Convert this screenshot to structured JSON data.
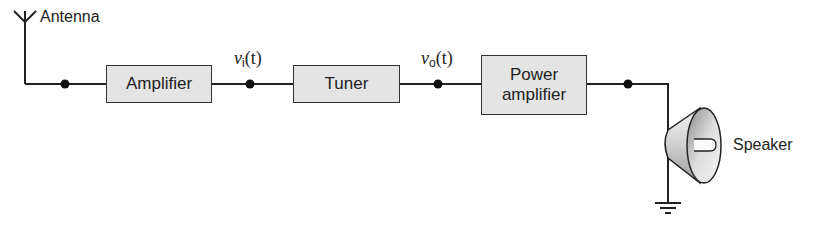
{
  "diagram": {
    "type": "block-diagram",
    "colors": {
      "wire": "#222222",
      "block_fill": "#e4e4e4",
      "block_border": "#333333"
    },
    "labels": {
      "antenna": "Antenna",
      "speaker": "Speaker"
    },
    "blocks": [
      {
        "id": "amplifier",
        "label": "Amplifier"
      },
      {
        "id": "tuner",
        "label": "Tuner"
      },
      {
        "id": "power-amplifier",
        "label_line1": "Power",
        "label_line2": "amplifier"
      }
    ],
    "signals": [
      {
        "id": "vi",
        "symbol": "v",
        "subscript": "i",
        "arg": "(t)"
      },
      {
        "id": "vo",
        "symbol": "v",
        "subscript": "o",
        "arg": "(t)"
      }
    ],
    "nodes": 4,
    "ground": true
  }
}
